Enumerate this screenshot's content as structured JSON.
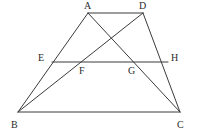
{
  "figure": {
    "type": "geometry-diagram",
    "stroke_color": "#3b3b3b",
    "background_color": "#ffffff",
    "label_color": "#2b2b2b",
    "width": 197,
    "height": 137,
    "points": [
      {
        "name": "A",
        "label": "A",
        "x": 88,
        "y": 13,
        "label_x": 84,
        "label_y": 1
      },
      {
        "name": "D",
        "label": "D",
        "x": 143,
        "y": 13,
        "label_x": 139,
        "label_y": 1
      },
      {
        "name": "E",
        "label": "E",
        "x": 52,
        "y": 62,
        "label_x": 38,
        "label_y": 53
      },
      {
        "name": "H",
        "label": "H",
        "x": 168,
        "y": 62,
        "label_x": 171,
        "label_y": 53
      },
      {
        "name": "F",
        "label": "F",
        "x": 82,
        "y": 62,
        "label_x": 79,
        "label_y": 66
      },
      {
        "name": "G",
        "label": "G",
        "x": 136,
        "y": 62,
        "label_x": 128,
        "label_y": 66
      },
      {
        "name": "B",
        "label": "B",
        "x": 18,
        "y": 112,
        "label_x": 11,
        "label_y": 120
      },
      {
        "name": "C",
        "label": "C",
        "x": 180,
        "y": 112,
        "label_x": 177,
        "label_y": 120
      }
    ],
    "segments": [
      {
        "name": "segment-AD",
        "from": "A",
        "to": "D",
        "x1": 88,
        "y1": 13,
        "x2": 143,
        "y2": 13
      },
      {
        "name": "segment-BC",
        "from": "B",
        "to": "C",
        "x1": 18,
        "y1": 112,
        "x2": 180,
        "y2": 112
      },
      {
        "name": "segment-AB",
        "from": "A",
        "to": "B",
        "x1": 88,
        "y1": 13,
        "x2": 18,
        "y2": 112
      },
      {
        "name": "segment-DC",
        "from": "D",
        "to": "C",
        "x1": 143,
        "y1": 13,
        "x2": 180,
        "y2": 112
      },
      {
        "name": "segment-EH",
        "from": "E",
        "to": "H",
        "x1": 52,
        "y1": 62,
        "x2": 168,
        "y2": 62
      },
      {
        "name": "segment-BD",
        "from": "B",
        "to": "D",
        "x1": 18,
        "y1": 112,
        "x2": 143,
        "y2": 13
      },
      {
        "name": "segment-AC",
        "from": "A",
        "to": "C",
        "x1": 88,
        "y1": 13,
        "x2": 180,
        "y2": 112
      }
    ]
  }
}
